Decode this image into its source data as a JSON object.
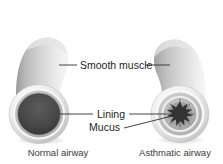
{
  "figure": {
    "background_color": "#ffffff",
    "labels": {
      "smooth_muscle": "Smooth muscle",
      "lining": "Lining",
      "mucus": "Mucus"
    },
    "captions": {
      "normal": "Normal airway",
      "asthmatic": "Asthmatic airway"
    },
    "colors": {
      "text": "#252525",
      "caption_text": "#3a3a3a",
      "leader_line": "#2f2f2f",
      "muscle_light": "#e8e8e8",
      "muscle_mid": "#b4b4b4",
      "muscle_dark": "#8d8d8d",
      "lining_ring": "#f2f2f2",
      "lumen_dark": "#4a4a4a",
      "lumen_darkest": "#2a2a2a",
      "mucus_dark": "#333333",
      "shadow": "#d9d9d9"
    },
    "normal_airway": {
      "name": "normal-airway",
      "lumen_state": "open",
      "wall_thickness": "thin",
      "lumen_diameter_px": 40
    },
    "asthmatic_airway": {
      "name": "asthmatic-airway",
      "lumen_state": "constricted",
      "wall_thickness": "thick",
      "lumen_diameter_px": 17,
      "mucus_present": true
    }
  }
}
